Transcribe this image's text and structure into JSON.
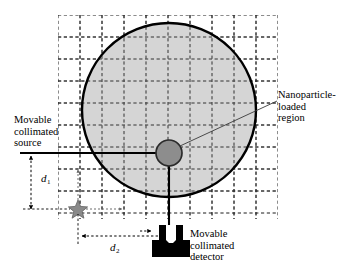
{
  "figure": {
    "type": "schematic-diagram",
    "title": ""
  },
  "labels": {
    "source": {
      "name": "movable-collimated-source",
      "line1": "Movable",
      "line2": "collimated",
      "line3": "source"
    },
    "nanoparticle": {
      "name": "nanoparticle-loaded-region",
      "line1": "Nanoparticle-",
      "line2": "loaded",
      "line3": "region"
    },
    "detector": {
      "name": "movable-collimated-detector",
      "line1": "Movable",
      "line2": "collimated",
      "line3": "detector"
    }
  },
  "dimensions": [
    {
      "name": "d1",
      "symbol": "d",
      "subscript": "1",
      "orientation": "vertical",
      "meaning": "vertical offset between source beam axis and star marker"
    },
    {
      "name": "d2",
      "symbol": "d",
      "subscript": "2",
      "orientation": "horizontal",
      "meaning": "horizontal offset between star marker and detector"
    }
  ],
  "geometry": {
    "grid": {
      "x_start": 58,
      "y_start": 15,
      "x_end": 278,
      "y_end": 219,
      "spacing": 22,
      "style": "dashed",
      "color": "#1a1a1a"
    },
    "phantom_circle": {
      "cx": 169,
      "cy": 110,
      "r": 87,
      "fill": "#c9c9c9",
      "stroke": "#000000",
      "stroke_width": 2.4
    },
    "nanoparticle_circle": {
      "cx": 169,
      "cy": 153,
      "r": 13,
      "fill": "#8d8d8d",
      "stroke": "#2b2b2b",
      "stroke_width": 1.6
    },
    "star_marker": {
      "cx": 78,
      "cy": 209,
      "r": 8,
      "fill": "#8a8a8a",
      "stroke": "#5a5a5a"
    },
    "source_beam": {
      "x_from": 20,
      "x_to": 169,
      "y": 153,
      "color": "#000000"
    },
    "detector_beam": {
      "x": 169,
      "y_from": 153,
      "y_to": 228,
      "color": "#000000"
    },
    "detector_body": {
      "color": "#000000",
      "base_x": 152,
      "base_y": 240,
      "base_w": 38,
      "base_h": 16,
      "neck_x": 159,
      "neck_y": 224,
      "neck_w": 23,
      "neck_h": 18
    }
  },
  "colors": {
    "phantom_fill": "#c9c9c9",
    "nanoparticle_fill": "#8d8d8d",
    "star_fill": "#8a8a8a",
    "detector_fill": "#000000",
    "grid_line": "#1a1a1a",
    "outline": "#000000",
    "background": "#ffffff"
  }
}
